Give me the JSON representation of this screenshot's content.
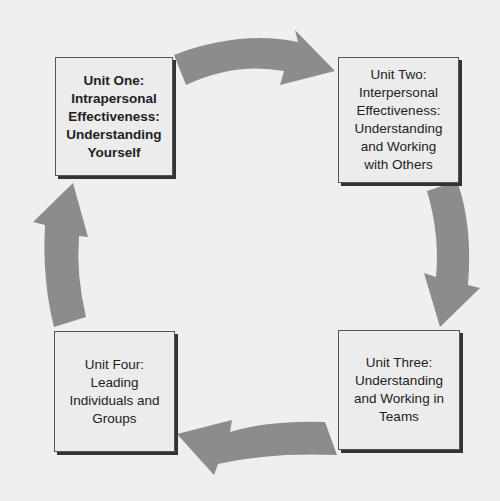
{
  "diagram": {
    "type": "cycle",
    "colors": {
      "background": "#efefef",
      "box_fill": "#ececec",
      "box_border": "#555555",
      "arrow": "#8c8c8c",
      "text": "#222222"
    },
    "units": [
      {
        "id": "unit-one",
        "label": "Unit One:\nIntrapersonal\nEffectiveness:\nUnderstanding\nYourself",
        "bold": true
      },
      {
        "id": "unit-two",
        "label": "Unit Two:\nInterpersonal\nEffectiveness:\nUnderstanding\nand Working\nwith Others",
        "bold": false
      },
      {
        "id": "unit-three",
        "label": "Unit Three:\nUnderstanding\nand Working in\nTeams",
        "bold": false
      },
      {
        "id": "unit-four",
        "label": "Unit Four:\nLeading\nIndividuals and\nGroups",
        "bold": false
      }
    ],
    "arrows": [
      {
        "from": "unit-one",
        "to": "unit-two",
        "direction": "right"
      },
      {
        "from": "unit-two",
        "to": "unit-three",
        "direction": "down"
      },
      {
        "from": "unit-three",
        "to": "unit-four",
        "direction": "left"
      },
      {
        "from": "unit-four",
        "to": "unit-one",
        "direction": "up"
      }
    ]
  }
}
